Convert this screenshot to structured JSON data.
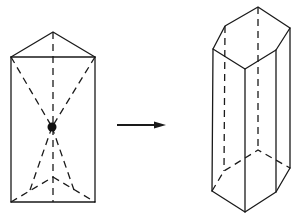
{
  "diagram": {
    "colors": {
      "stroke": "#1a1a1a",
      "background": "#ffffff"
    },
    "left_shape": {
      "name": "triangular-prism",
      "center_point": [
        52,
        127
      ]
    },
    "arrow": {
      "direction": "right",
      "from": [
        117,
        125
      ],
      "to": [
        166,
        125
      ]
    },
    "right_shape": {
      "name": "hexagonal-prism"
    }
  }
}
